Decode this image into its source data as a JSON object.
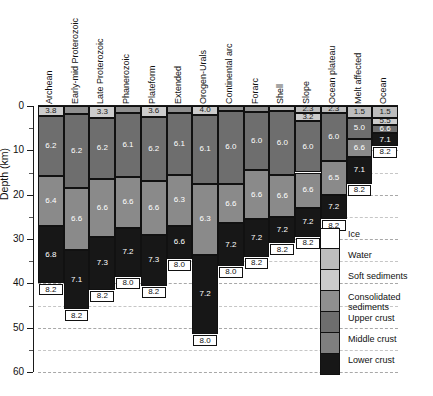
{
  "axis": {
    "y_title": "Depth (km)",
    "y_ticks": [
      "0",
      "10",
      "20",
      "30",
      "40",
      "50",
      "60"
    ],
    "y_min": 0,
    "y_max": 60,
    "y_unit": "km"
  },
  "legend": {
    "items": [
      {
        "label": "Ice",
        "color": "#ffffff"
      },
      {
        "label": "Water",
        "color": "#bdbdbd"
      },
      {
        "label": "Soft sediments",
        "color": "#cccccc"
      },
      {
        "label": "Consolidated\nsediments",
        "color": "#8f8f8f"
      },
      {
        "label": "Upper crust",
        "color": "#6e6e6e"
      },
      {
        "label": "Middle crust",
        "color": "#7f7f7f"
      },
      {
        "label": "Lower crust",
        "color": "#171717"
      }
    ]
  },
  "colors": {
    "ice": "#ffffff",
    "water": "#bdbdbd",
    "soft": "#cccccc",
    "consolidated": "#8f8f8f",
    "upper": "#6e6e6e",
    "middle": "#8a8a8a",
    "lower": "#171717",
    "mantle_text": "#111111"
  },
  "chart_data": {
    "type": "bar",
    "title": "",
    "xlabel": "",
    "ylabel": "Depth (km)",
    "ylim": [
      0,
      60
    ],
    "y_inverted": true,
    "grid": true,
    "legend_position": "right",
    "layer_order": [
      "ice",
      "water",
      "soft",
      "consolidated",
      "upper",
      "middle",
      "lower"
    ],
    "value_unit": "km/s (P-wave velocity)",
    "categories": [
      "Archean",
      "Early-mid Proterozoic",
      "Late Proterozoic",
      "Phanerozoic",
      "Plateform",
      "Extended",
      "Orogen-Urals",
      "Continental arc",
      "Forarc",
      "Shell",
      "Slope",
      "Ocean plateau",
      "Melt affected",
      "Ocean"
    ],
    "columns": [
      {
        "name": "Archean",
        "layers": [
          {
            "type": "soft",
            "top": 0.0,
            "bottom": 2.2,
            "value": "3.8"
          },
          {
            "type": "upper",
            "top": 2.2,
            "bottom": 15.8,
            "value": "6.2"
          },
          {
            "type": "middle",
            "top": 15.8,
            "bottom": 27.0,
            "value": "6.4"
          },
          {
            "type": "lower",
            "top": 27.0,
            "bottom": 40.0,
            "value": "6.8"
          }
        ],
        "mantle": {
          "value": "8.2",
          "depth": 40.0
        }
      },
      {
        "name": "Early-mid Proterozoic",
        "layers": [
          {
            "type": "consolidated",
            "top": 0.0,
            "bottom": 1.8,
            "value": ""
          },
          {
            "type": "upper",
            "top": 1.8,
            "bottom": 18.5,
            "value": "6.2"
          },
          {
            "type": "middle",
            "top": 18.5,
            "bottom": 32.5,
            "value": "6.6"
          },
          {
            "type": "lower",
            "top": 32.5,
            "bottom": 45.8,
            "value": "7.1"
          }
        ],
        "mantle": {
          "value": "8.2",
          "depth": 45.8
        }
      },
      {
        "name": "Late Proterozoic",
        "layers": [
          {
            "type": "soft",
            "top": 0.0,
            "bottom": 2.6,
            "value": "3.3"
          },
          {
            "type": "upper",
            "top": 2.6,
            "bottom": 16.5,
            "value": "6.2"
          },
          {
            "type": "middle",
            "top": 16.5,
            "bottom": 29.5,
            "value": "6.6"
          },
          {
            "type": "lower",
            "top": 29.5,
            "bottom": 41.5,
            "value": "7.3"
          }
        ],
        "mantle": {
          "value": "8.2",
          "depth": 41.5
        }
      },
      {
        "name": "Phanerozoic",
        "layers": [
          {
            "type": "consolidated",
            "top": 0.0,
            "bottom": 1.6,
            "value": ""
          },
          {
            "type": "upper",
            "top": 1.6,
            "bottom": 16.0,
            "value": "6.1"
          },
          {
            "type": "middle",
            "top": 16.0,
            "bottom": 27.5,
            "value": "6.6"
          },
          {
            "type": "lower",
            "top": 27.5,
            "bottom": 38.5,
            "value": "7.2"
          }
        ],
        "mantle": {
          "value": "8.0",
          "depth": 38.5
        }
      },
      {
        "name": "Plateform",
        "layers": [
          {
            "type": "soft",
            "top": 0.0,
            "bottom": 2.4,
            "value": "3.6"
          },
          {
            "type": "upper",
            "top": 2.4,
            "bottom": 17.0,
            "value": "6.2"
          },
          {
            "type": "middle",
            "top": 17.0,
            "bottom": 29.0,
            "value": "6.6"
          },
          {
            "type": "lower",
            "top": 29.0,
            "bottom": 40.5,
            "value": "7.3"
          }
        ],
        "mantle": {
          "value": "8.2",
          "depth": 40.5
        }
      },
      {
        "name": "Extended",
        "layers": [
          {
            "type": "consolidated",
            "top": 0.0,
            "bottom": 1.5,
            "value": ""
          },
          {
            "type": "upper",
            "top": 1.5,
            "bottom": 15.5,
            "value": "6.1"
          },
          {
            "type": "middle",
            "top": 15.5,
            "bottom": 27.0,
            "value": "6.3"
          },
          {
            "type": "lower",
            "top": 27.0,
            "bottom": 34.5,
            "value": "6.6"
          }
        ],
        "mantle": {
          "value": "8.0",
          "depth": 34.5
        }
      },
      {
        "name": "Orogen-Urals",
        "layers": [
          {
            "type": "soft",
            "top": 0.0,
            "bottom": 2.0,
            "value": "4.0"
          },
          {
            "type": "upper",
            "top": 2.0,
            "bottom": 17.5,
            "value": "6.1"
          },
          {
            "type": "middle",
            "top": 17.5,
            "bottom": 33.5,
            "value": "6.3"
          },
          {
            "type": "lower",
            "top": 33.5,
            "bottom": 51.5,
            "value": "7.2"
          }
        ],
        "mantle": {
          "value": "8.0",
          "depth": 51.5
        }
      },
      {
        "name": "Continental arc",
        "layers": [
          {
            "type": "consolidated",
            "top": 0.0,
            "bottom": 1.2,
            "value": ""
          },
          {
            "type": "upper",
            "top": 1.2,
            "bottom": 17.5,
            "value": "6.0"
          },
          {
            "type": "middle",
            "top": 17.5,
            "bottom": 26.5,
            "value": "6.6"
          },
          {
            "type": "lower",
            "top": 26.5,
            "bottom": 36.0,
            "value": "7.2"
          }
        ],
        "mantle": {
          "value": "8.0",
          "depth": 36.0
        }
      },
      {
        "name": "Forarc",
        "layers": [
          {
            "type": "consolidated",
            "top": 0.0,
            "bottom": 1.4,
            "value": ""
          },
          {
            "type": "upper",
            "top": 1.4,
            "bottom": 14.5,
            "value": "6.0"
          },
          {
            "type": "middle",
            "top": 14.5,
            "bottom": 25.5,
            "value": "6.6"
          },
          {
            "type": "lower",
            "top": 25.5,
            "bottom": 34.0,
            "value": "7.2"
          }
        ],
        "mantle": {
          "value": "8.2",
          "depth": 34.0
        }
      },
      {
        "name": "Shell",
        "layers": [
          {
            "type": "water",
            "top": 0.0,
            "bottom": 1.2,
            "value": ""
          },
          {
            "type": "upper",
            "top": 1.2,
            "bottom": 15.5,
            "value": "6.0"
          },
          {
            "type": "middle",
            "top": 15.5,
            "bottom": 25.0,
            "value": "6.6"
          },
          {
            "type": "lower",
            "top": 25.0,
            "bottom": 31.0,
            "value": "7.2"
          }
        ],
        "mantle": {
          "value": "8.2",
          "depth": 31.0
        }
      },
      {
        "name": "Slope",
        "layers": [
          {
            "type": "water",
            "top": 0.0,
            "bottom": 1.5,
            "value": "2.3"
          },
          {
            "type": "soft",
            "top": 1.5,
            "bottom": 3.4,
            "value": "3.2"
          },
          {
            "type": "upper",
            "top": 3.4,
            "bottom": 15.0,
            "value": "6.0"
          },
          {
            "type": "middle",
            "top": 15.0,
            "bottom": 23.0,
            "value": "6.6"
          },
          {
            "type": "lower",
            "top": 23.0,
            "bottom": 29.5,
            "value": "7.2"
          }
        ],
        "mantle": {
          "value": "8.2",
          "depth": 29.5
        }
      },
      {
        "name": "Ocean plateau",
        "layers": [
          {
            "type": "water",
            "top": 0.0,
            "bottom": 1.5,
            "value": "2.3"
          },
          {
            "type": "upper",
            "top": 1.5,
            "bottom": 12.5,
            "value": "6.0"
          },
          {
            "type": "middle",
            "top": 12.5,
            "bottom": 20.0,
            "value": "6.5"
          },
          {
            "type": "lower",
            "top": 20.0,
            "bottom": 25.5,
            "value": "7.2"
          }
        ],
        "mantle": {
          "value": "8.2",
          "depth": 25.5
        }
      },
      {
        "name": "Melt affected",
        "layers": [
          {
            "type": "water",
            "top": 0.0,
            "bottom": 2.6,
            "value": "1.5"
          },
          {
            "type": "upper",
            "top": 2.6,
            "bottom": 7.5,
            "value": "5.0"
          },
          {
            "type": "middle",
            "top": 7.5,
            "bottom": 11.5,
            "value": "6.6"
          },
          {
            "type": "lower",
            "top": 11.5,
            "bottom": 17.5,
            "value": "7.1"
          }
        ],
        "mantle": {
          "value": "8.2",
          "depth": 17.5
        }
      },
      {
        "name": "Ocean",
        "layers": [
          {
            "type": "water",
            "top": 0.0,
            "bottom": 2.6,
            "value": "1.5"
          },
          {
            "type": "soft",
            "top": 2.6,
            "bottom": 4.2,
            "value": "5.5"
          },
          {
            "type": "upper",
            "top": 4.2,
            "bottom": 6.2,
            "value": "6.6"
          },
          {
            "type": "lower",
            "top": 6.2,
            "bottom": 9.0,
            "value": "7.1"
          }
        ],
        "mantle": {
          "value": "8.2",
          "depth": 9.0
        }
      }
    ]
  }
}
